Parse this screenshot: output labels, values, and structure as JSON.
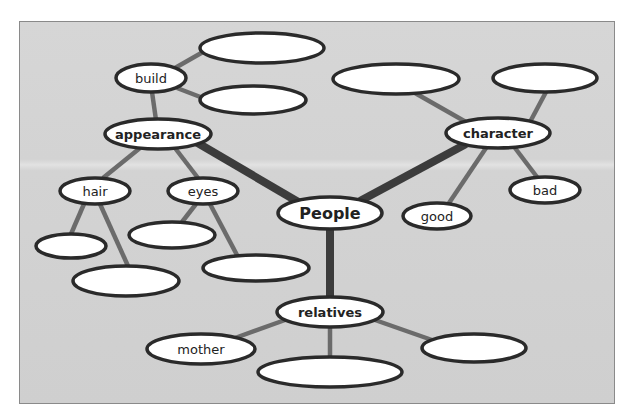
{
  "diagram": {
    "type": "mind-map",
    "colors": {
      "background": "#d3d3d3",
      "node_fill": "#ffffff",
      "node_stroke": "#2a2a2a",
      "thin_edge": "#6b6b6b",
      "thick_edge": "#3c3c3c"
    },
    "root": {
      "id": "people",
      "label": "People"
    },
    "nodes": {
      "people": {
        "label": "People"
      },
      "appearance": {
        "label": "appearance"
      },
      "character": {
        "label": "character"
      },
      "relatives": {
        "label": "relatives"
      },
      "build": {
        "label": "build"
      },
      "hair": {
        "label": "hair"
      },
      "eyes": {
        "label": "eyes"
      },
      "good": {
        "label": "good"
      },
      "bad": {
        "label": "bad"
      },
      "mother": {
        "label": "mother"
      },
      "build_blank_1": {
        "label": ""
      },
      "build_blank_2": {
        "label": ""
      },
      "hair_blank_1": {
        "label": ""
      },
      "hair_blank_2": {
        "label": ""
      },
      "eyes_blank_1": {
        "label": ""
      },
      "eyes_blank_2": {
        "label": ""
      },
      "character_blank_1": {
        "label": ""
      },
      "character_blank_2": {
        "label": ""
      },
      "relatives_blank_1": {
        "label": ""
      },
      "relatives_blank_2": {
        "label": ""
      }
    },
    "edges": [
      {
        "from": "people",
        "to": "appearance",
        "weight": "thick"
      },
      {
        "from": "people",
        "to": "character",
        "weight": "thick"
      },
      {
        "from": "people",
        "to": "relatives",
        "weight": "thick"
      },
      {
        "from": "appearance",
        "to": "build",
        "weight": "thin"
      },
      {
        "from": "appearance",
        "to": "hair",
        "weight": "thin"
      },
      {
        "from": "appearance",
        "to": "eyes",
        "weight": "thin"
      },
      {
        "from": "build",
        "to": "build_blank_1",
        "weight": "thin"
      },
      {
        "from": "build",
        "to": "build_blank_2",
        "weight": "thin"
      },
      {
        "from": "hair",
        "to": "hair_blank_1",
        "weight": "thin"
      },
      {
        "from": "hair",
        "to": "hair_blank_2",
        "weight": "thin"
      },
      {
        "from": "eyes",
        "to": "eyes_blank_1",
        "weight": "thin"
      },
      {
        "from": "eyes",
        "to": "eyes_blank_2",
        "weight": "thin"
      },
      {
        "from": "character",
        "to": "character_blank_1",
        "weight": "thin"
      },
      {
        "from": "character",
        "to": "character_blank_2",
        "weight": "thin"
      },
      {
        "from": "character",
        "to": "good",
        "weight": "thin"
      },
      {
        "from": "character",
        "to": "bad",
        "weight": "thin"
      },
      {
        "from": "relatives",
        "to": "mother",
        "weight": "thin"
      },
      {
        "from": "relatives",
        "to": "relatives_blank_1",
        "weight": "thin"
      },
      {
        "from": "relatives",
        "to": "relatives_blank_2",
        "weight": "thin"
      }
    ]
  }
}
